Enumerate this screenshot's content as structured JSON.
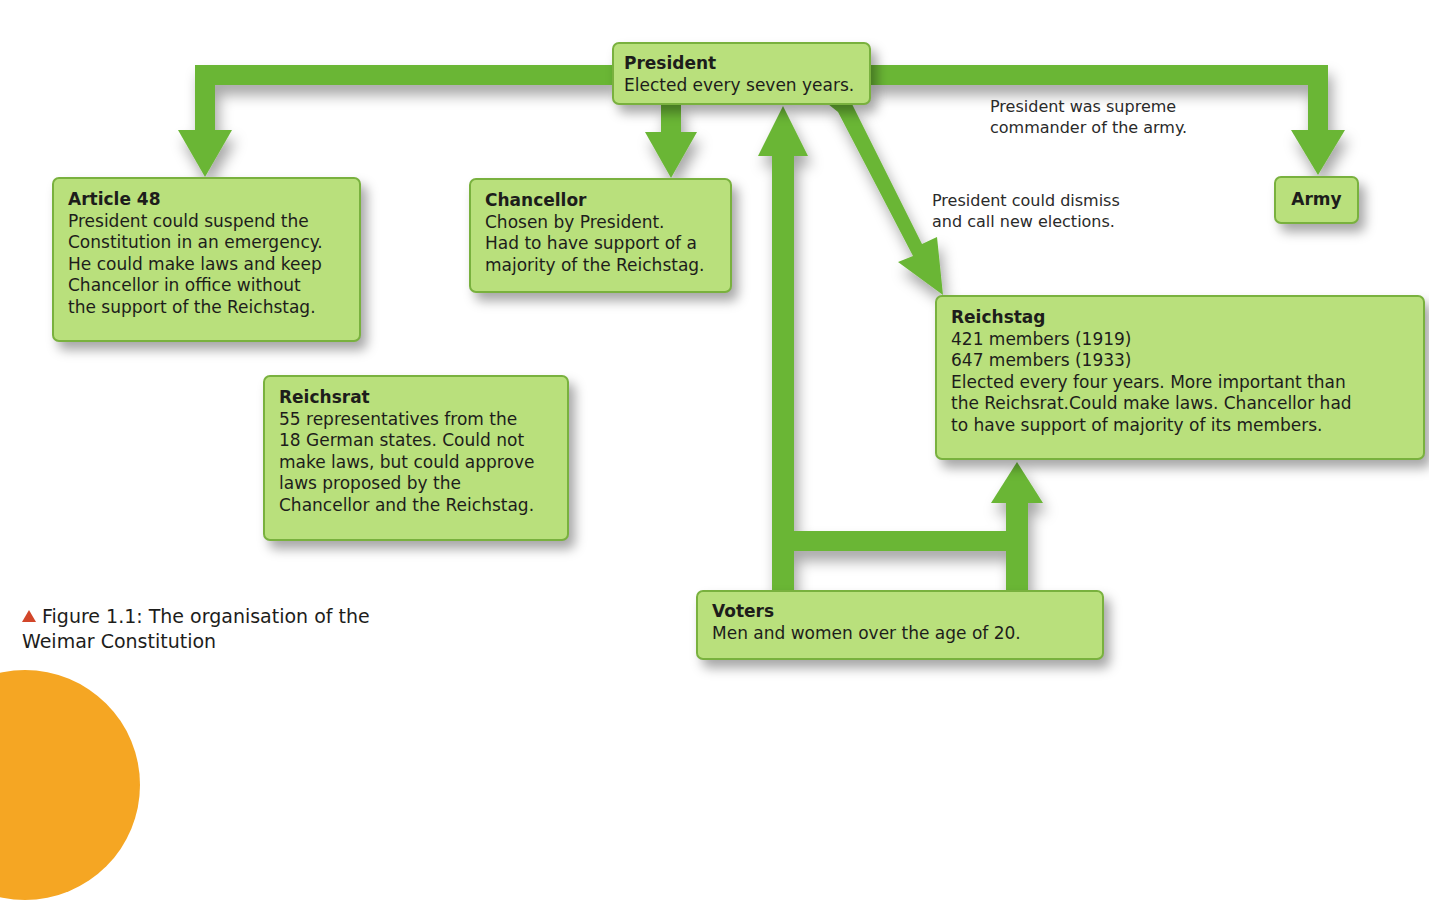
{
  "colors": {
    "arrow": "#6ab636",
    "box_fill": "#b9e07c",
    "box_border": "#79b13e",
    "caption_marker": "#d2462a",
    "decoration": "#f5a623"
  },
  "boxes": {
    "president": {
      "title": "President",
      "lines": [
        "Elected every seven years."
      ]
    },
    "article48": {
      "title": "Article 48",
      "lines": [
        "President could suspend the",
        "Constitution in an emergency.",
        "He could make laws and keep",
        "Chancellor in office without",
        "the support of the Reichstag."
      ]
    },
    "chancellor": {
      "title": "Chancellor",
      "lines": [
        "Chosen by President.",
        "Had to have support of a",
        "majority of the Reichstag."
      ]
    },
    "army": {
      "title": "Army"
    },
    "reichstag": {
      "title": "Reichstag",
      "lines": [
        "421 members (1919)",
        "647 members (1933)",
        "Elected every four years. More important than",
        "the Reichsrat.Could make laws. Chancellor had",
        "to have support of majority of its members."
      ]
    },
    "reichsrat": {
      "title": "Reichsrat",
      "lines": [
        "55 representatives from the",
        "18 German states. Could not",
        "make laws, but could approve",
        "laws proposed by the",
        "Chancellor and the Reichstag."
      ]
    },
    "voters": {
      "title": "Voters",
      "lines": [
        "Men and women over the age of 20."
      ]
    }
  },
  "notes": {
    "army_command": [
      "President was supreme",
      "commander of the army."
    ],
    "dismiss": [
      "President could dismiss",
      "and call new elections."
    ]
  },
  "caption": {
    "lines": [
      "Figure 1.1: The organisation of the",
      "Weimar Constitution"
    ]
  }
}
